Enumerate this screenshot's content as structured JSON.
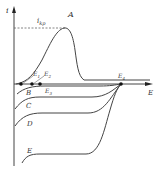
{
  "diagram": {
    "type": "polarization-curves",
    "axes": {
      "y_label": "i",
      "x_label": "E"
    },
    "reference_line": {
      "label_main": "i",
      "label_sub": "kp"
    },
    "curves": [
      {
        "id": "A",
        "label": "A"
      },
      {
        "id": "B",
        "label": "B"
      },
      {
        "id": "C",
        "label": "C"
      },
      {
        "id": "D",
        "label": "D"
      },
      {
        "id": "E",
        "label": "E"
      }
    ],
    "points": [
      {
        "label_main": "E",
        "label_sub": "1"
      },
      {
        "label_main": "E",
        "label_sub": "2"
      },
      {
        "label_main": "E",
        "label_sub": "3"
      },
      {
        "label_main": "E",
        "label_sub": "4"
      }
    ],
    "colors": {
      "line": "#555555",
      "text": "#333333",
      "background": "#ffffff"
    }
  }
}
